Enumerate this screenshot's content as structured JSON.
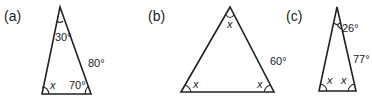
{
  "figures": [
    {
      "id": "a",
      "panel_label": "(a)",
      "vertices": {
        "apex": [
          60,
          7
        ],
        "left": [
          42,
          94
        ],
        "right": [
          91,
          94
        ]
      },
      "labels": {
        "apex_angle": "30°",
        "left_angle": "x",
        "right_angle": "70°",
        "right_side": "80°"
      }
    },
    {
      "id": "b",
      "panel_label": "(b)",
      "vertices": {
        "apex": [
          230,
          7
        ],
        "left": [
          181,
          92
        ],
        "right": [
          274,
          92
        ]
      },
      "labels": {
        "apex_angle": "x",
        "left_angle": "x",
        "right_angle": "x",
        "right_side": "60°"
      }
    },
    {
      "id": "c",
      "panel_label": "(c)",
      "vertices": {
        "apex": [
          337,
          7
        ],
        "left": [
          319,
          91
        ],
        "right": [
          356,
          91
        ]
      },
      "labels": {
        "apex_angle": "26°",
        "left_angle": "x",
        "right_angle": "x",
        "right_side": "77°"
      }
    }
  ],
  "colors": {
    "line": "#222222",
    "background": "#ffffff"
  }
}
